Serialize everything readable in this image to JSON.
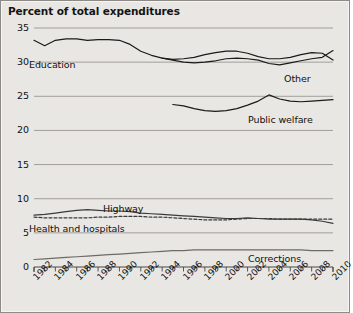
{
  "chart_data": {
    "type": "line",
    "title": "Percent of total expenditures",
    "xlabel": "",
    "ylabel": "",
    "xlim": [
      1982,
      2010
    ],
    "ylim": [
      0,
      35
    ],
    "ytick_values": [
      0,
      5,
      10,
      15,
      20,
      25,
      30,
      35
    ],
    "ytick_labels": [
      "0",
      "5",
      "10",
      "15",
      "20",
      "25",
      "30",
      "35"
    ],
    "xtick_values": [
      1982,
      1984,
      1986,
      1988,
      1990,
      1992,
      1994,
      1996,
      1998,
      2000,
      2002,
      2004,
      2006,
      2008,
      2010
    ],
    "xtick_labels": [
      "1982",
      "1984",
      "1986",
      "1988",
      "1990",
      "1992",
      "1994",
      "1996",
      "1998",
      "2000",
      "2002",
      "2004",
      "2006",
      "2008",
      "2010"
    ],
    "minor_xticks_every": 1,
    "grid": "horizontal",
    "legend": "inline-labels",
    "series": [
      {
        "name": "Education",
        "style": "solid",
        "color": "#1a1a1a",
        "x": [
          1982,
          1983,
          1984,
          1985,
          1986,
          1987,
          1988,
          1989,
          1990,
          1991,
          1992,
          1993,
          1994,
          1995,
          1996,
          1997,
          1998,
          1999,
          2000,
          2001,
          2002,
          2003,
          2004,
          2005,
          2006,
          2007,
          2008,
          2009,
          2010
        ],
        "y": [
          33.2,
          32.4,
          33.2,
          33.4,
          33.4,
          33.2,
          33.3,
          33.3,
          33.2,
          32.6,
          31.6,
          31.0,
          30.6,
          30.4,
          30.5,
          30.7,
          31.1,
          31.4,
          31.6,
          31.6,
          31.3,
          30.8,
          30.5,
          30.5,
          30.7,
          31.1,
          31.4,
          31.3,
          30.3
        ]
      },
      {
        "name": "Other",
        "style": "solid",
        "color": "#1a1a1a",
        "x": [
          1994,
          1995,
          1996,
          1997,
          1998,
          1999,
          2000,
          2001,
          2002,
          2003,
          2004,
          2005,
          2006,
          2007,
          2008,
          2009,
          2010
        ],
        "y": [
          30.6,
          30.3,
          30.0,
          29.9,
          30.0,
          30.2,
          30.5,
          30.6,
          30.5,
          30.3,
          29.8,
          29.6,
          29.9,
          30.2,
          30.5,
          30.7,
          31.7
        ]
      },
      {
        "name": "Public welfare",
        "style": "solid",
        "color": "#1a1a1a",
        "x": [
          1995,
          1996,
          1997,
          1998,
          1999,
          2000,
          2001,
          2002,
          2003,
          2004,
          2005,
          2006,
          2007,
          2008,
          2009,
          2010
        ],
        "y": [
          23.8,
          23.6,
          23.2,
          22.9,
          22.8,
          22.9,
          23.2,
          23.7,
          24.3,
          25.2,
          24.6,
          24.3,
          24.2,
          24.3,
          24.4,
          24.5
        ]
      },
      {
        "name": "Highway",
        "style": "solid",
        "color": "#3a3a3a",
        "x": [
          1982,
          1983,
          1984,
          1985,
          1986,
          1987,
          1988,
          1989,
          1990,
          1991,
          1992,
          1993,
          1994,
          1995,
          1996,
          1997,
          1998,
          1999,
          2000,
          2001,
          2002,
          2003,
          2004,
          2005,
          2006,
          2007,
          2008,
          2009,
          2010
        ],
        "y": [
          7.6,
          7.7,
          7.9,
          8.1,
          8.3,
          8.4,
          8.3,
          8.2,
          8.2,
          8.1,
          7.9,
          7.8,
          7.7,
          7.6,
          7.5,
          7.4,
          7.3,
          7.2,
          7.1,
          7.1,
          7.2,
          7.1,
          7.0,
          7.0,
          7.0,
          7.0,
          6.9,
          6.7,
          6.4
        ]
      },
      {
        "name": "Health and hospitals",
        "style": "dashed",
        "color": "#3a3a3a",
        "x": [
          1982,
          1983,
          1984,
          1985,
          1986,
          1987,
          1988,
          1989,
          1990,
          1991,
          1992,
          1993,
          1994,
          1995,
          1996,
          1997,
          1998,
          1999,
          2000,
          2001,
          2002,
          2003,
          2004,
          2005,
          2006,
          2007,
          2008,
          2009,
          2010
        ],
        "y": [
          7.3,
          7.2,
          7.2,
          7.2,
          7.2,
          7.2,
          7.3,
          7.3,
          7.4,
          7.4,
          7.4,
          7.3,
          7.3,
          7.2,
          7.1,
          7.0,
          6.9,
          6.9,
          6.9,
          7.0,
          7.1,
          7.1,
          7.1,
          7.0,
          7.0,
          7.0,
          7.0,
          7.0,
          7.0
        ]
      },
      {
        "name": "Corrections",
        "style": "solid",
        "color": "#6e6b67",
        "x": [
          1982,
          1983,
          1984,
          1985,
          1986,
          1987,
          1988,
          1989,
          1990,
          1991,
          1992,
          1993,
          1994,
          1995,
          1996,
          1997,
          1998,
          1999,
          2000,
          2001,
          2002,
          2003,
          2004,
          2005,
          2006,
          2007,
          2008,
          2009,
          2010
        ],
        "y": [
          1.1,
          1.2,
          1.3,
          1.4,
          1.5,
          1.6,
          1.7,
          1.8,
          1.9,
          2.0,
          2.1,
          2.2,
          2.3,
          2.4,
          2.4,
          2.5,
          2.5,
          2.5,
          2.5,
          2.5,
          2.5,
          2.5,
          2.5,
          2.5,
          2.5,
          2.5,
          2.4,
          2.4,
          2.4
        ]
      }
    ],
    "annotations": [
      {
        "text": "Education",
        "x_px": 28,
        "y_px": 58
      },
      {
        "text": "Other",
        "x_px": 283,
        "y_px": 72
      },
      {
        "text": "Public welfare",
        "x_px": 247,
        "y_px": 113
      },
      {
        "text": "Highway",
        "x_px": 102,
        "y_px": 202
      },
      {
        "text": "Health and hospitals",
        "x_px": 28,
        "y_px": 222
      },
      {
        "text": "Corrections",
        "x_px": 247,
        "y_px": 252
      }
    ]
  }
}
